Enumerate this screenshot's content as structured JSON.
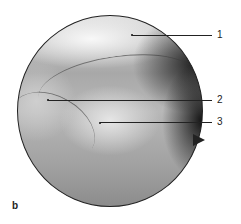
{
  "figure": {
    "panel_letter": "b",
    "labels": [
      {
        "id": "1",
        "text": "1"
      },
      {
        "id": "2",
        "text": "2"
      },
      {
        "id": "3",
        "text": "3"
      }
    ]
  }
}
